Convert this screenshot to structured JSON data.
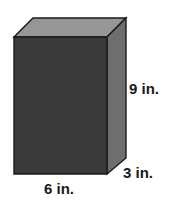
{
  "figure": {
    "name": "rectangular-prism",
    "type": "3d-solid-diagram",
    "background_color": "#ffffff",
    "faces": {
      "front": {
        "label": "front-face",
        "color": "#3a3a3a",
        "points": "14,37 107,37 107,174 14,174"
      },
      "top": {
        "label": "top-face",
        "color": "#969696",
        "points": "14,37 33,18 126,18 107,37"
      },
      "right": {
        "label": "right-face",
        "color": "#6e6e6e",
        "points": "107,37 126,18 126,158 107,174"
      }
    },
    "outline_color": "#1a1a1a",
    "outline_width": 1.4
  },
  "labels": {
    "height": "9 in.",
    "depth": "3 in.",
    "width": "6 in."
  },
  "measurements": {
    "height_value": 9,
    "depth_value": 3,
    "width_value": 6,
    "unit": "in."
  }
}
